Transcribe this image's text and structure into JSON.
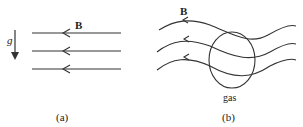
{
  "panel_a": {
    "field_label": "B",
    "gravity_label": "g",
    "caption": "(a)",
    "field_lines": 3,
    "field_direction": "left"
  },
  "panel_b": {
    "field_label": "B",
    "gas_label": "gas",
    "caption": "(b)",
    "field_lines": 3,
    "field_direction": "left"
  },
  "colors": {
    "line": "#333333",
    "background": "#ffffff"
  }
}
